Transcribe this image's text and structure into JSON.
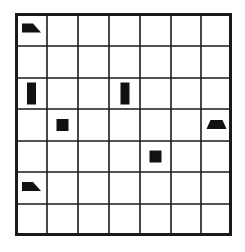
{
  "grid": {
    "rows": 7,
    "columns": 7,
    "line_color": "#1a1a1a",
    "background_color": "#ffffff",
    "shape_color": "#111111",
    "cells": [
      {
        "row": 0,
        "col": 0,
        "shape": "wedge-right"
      },
      {
        "row": 2,
        "col": 0,
        "shape": "vertical-bar"
      },
      {
        "row": 2,
        "col": 3,
        "shape": "vertical-bar"
      },
      {
        "row": 3,
        "col": 1,
        "shape": "square"
      },
      {
        "row": 3,
        "col": 6,
        "shape": "trapezoid"
      },
      {
        "row": 4,
        "col": 4,
        "shape": "square"
      },
      {
        "row": 5,
        "col": 0,
        "shape": "wedge-right"
      }
    ]
  }
}
